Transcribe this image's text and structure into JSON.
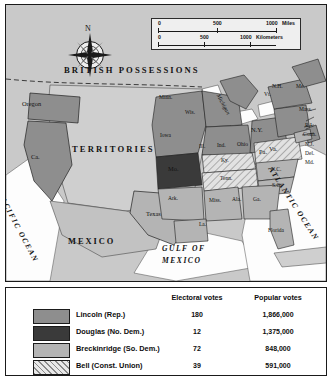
{
  "map": {
    "background_color": "#c9c9c9",
    "compass": {
      "north_label": "N"
    },
    "scale": {
      "miles": {
        "unit_label": "Miles",
        "ticks": [
          "0",
          "500",
          "1000"
        ]
      },
      "kilometers": {
        "unit_label": "Kilometers",
        "ticks": [
          "0",
          "500",
          "1000"
        ]
      }
    },
    "regions": [
      {
        "name": "british-possessions",
        "label": "BRITISH  POSSESSIONS"
      },
      {
        "name": "territories",
        "label": "TERRITORIES"
      },
      {
        "name": "mexico",
        "label": "MEXICO"
      }
    ],
    "oceans": [
      {
        "name": "pacific-ocean",
        "label": "PACIFIC OCEAN"
      },
      {
        "name": "atlantic-ocean",
        "label": "ATLANTIC OCEAN"
      },
      {
        "name": "gulf-of-mexico",
        "label": "GULF OF MEXICO"
      }
    ],
    "states": [
      {
        "label": "Oregon",
        "party": "lincoln"
      },
      {
        "label": "Ca.",
        "party": "lincoln"
      },
      {
        "label": "Minn.",
        "party": "lincoln"
      },
      {
        "label": "Wis.",
        "party": "lincoln"
      },
      {
        "label": "Michigan",
        "party": "lincoln"
      },
      {
        "label": "Iowa",
        "party": "lincoln"
      },
      {
        "label": "Ill.",
        "party": "lincoln"
      },
      {
        "label": "Ind.",
        "party": "lincoln"
      },
      {
        "label": "Ohio",
        "party": "lincoln"
      },
      {
        "label": "Pa.",
        "party": "lincoln"
      },
      {
        "label": "N.Y.",
        "party": "lincoln"
      },
      {
        "label": "Vt.",
        "party": "lincoln"
      },
      {
        "label": "N.H.",
        "party": "lincoln"
      },
      {
        "label": "Me.",
        "party": "lincoln"
      },
      {
        "label": "Mass.",
        "party": "lincoln"
      },
      {
        "label": "R.I.",
        "party": "lincoln"
      },
      {
        "label": "Conn.",
        "party": "lincoln"
      },
      {
        "label": "N.J.",
        "party": "lincoln"
      },
      {
        "label": "Del.",
        "party": "lincoln"
      },
      {
        "label": "Md.",
        "party": "breckinridge"
      },
      {
        "label": "Mo.",
        "party": "douglas"
      },
      {
        "label": "Ky.",
        "party": "bell"
      },
      {
        "label": "Tenn.",
        "party": "bell"
      },
      {
        "label": "Va.",
        "party": "bell"
      },
      {
        "label": "N.C.",
        "party": "breckinridge"
      },
      {
        "label": "S.C.",
        "party": "breckinridge"
      },
      {
        "label": "Ga.",
        "party": "breckinridge"
      },
      {
        "label": "Ala.",
        "party": "breckinridge"
      },
      {
        "label": "Miss.",
        "party": "breckinridge"
      },
      {
        "label": "La.",
        "party": "breckinridge"
      },
      {
        "label": "Ark.",
        "party": "breckinridge"
      },
      {
        "label": "Texas",
        "party": "breckinridge"
      },
      {
        "label": "Florida",
        "party": "breckinridge"
      }
    ]
  },
  "legend": {
    "headers": {
      "electoral": "Electoral votes",
      "popular": "Popular votes"
    },
    "rows": [
      {
        "key": "lincoln",
        "candidate": "Lincoln (Rep.)",
        "electoral": "180",
        "popular": "1,866,000",
        "color": "#8e8e8e"
      },
      {
        "key": "douglas",
        "candidate": "Douglas (No. Dem.)",
        "electoral": "12",
        "popular": "1,375,000",
        "color": "#3a3a3a"
      },
      {
        "key": "breckinridge",
        "candidate": "Breckinridge (So. Dem.)",
        "electoral": "72",
        "popular": "848,000",
        "color": "#b4b4b4"
      },
      {
        "key": "bell",
        "candidate": "Bell (Const. Union)",
        "electoral": "39",
        "popular": "591,000",
        "color": "#e8e8e8"
      }
    ]
  }
}
